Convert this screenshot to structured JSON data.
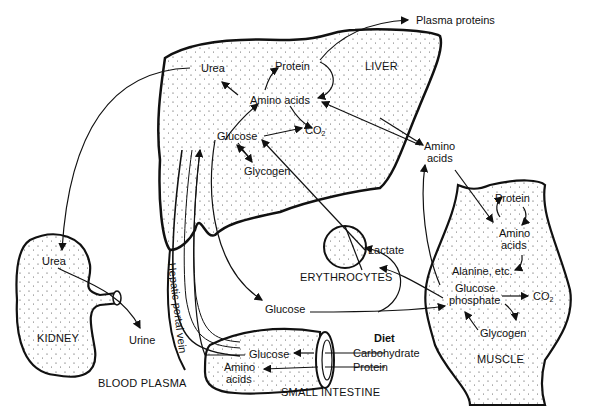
{
  "diagram": {
    "organs": {
      "liver": "LIVER",
      "kidney": "KIDNEY",
      "muscle": "MUSCLE",
      "erythrocytes": "ERYTHROCYTES",
      "small_intestine": "SMALL INTESTINE",
      "blood_plasma": "BLOOD PLASMA",
      "hepatic_portal_vein": "Hepatic portal vein"
    },
    "liver_labels": {
      "urea": "Urea",
      "protein": "Protein",
      "amino_acids": "Amino acids",
      "glucose": "Glucose",
      "co2": "CO",
      "co2_sub": "2",
      "glycogen": "Glycogen"
    },
    "plasma_labels": {
      "plasma_proteins": "Plasma proteins",
      "amino_acids_line1": "Amino",
      "amino_acids_line2": "acids",
      "lactate": "Lactate",
      "glucose": "Glucose",
      "urine": "Urine"
    },
    "kidney_labels": {
      "urea": "Urea"
    },
    "muscle_labels": {
      "protein": "Protein",
      "amino_line1": "Amino",
      "amino_line2": "acids",
      "alanine": "Alanine, etc.",
      "glucose_phosphate_line1": "Glucose",
      "glucose_phosphate_line2": "phosphate",
      "co2": "CO",
      "co2_sub": "2",
      "glycogen": "Glycogen"
    },
    "intestine_labels": {
      "glucose": "Glucose",
      "amino_line1": "Amino",
      "amino_line2": "acids"
    },
    "diet": {
      "title": "Diet",
      "items": [
        "Carbohydrate",
        "Protein"
      ]
    }
  },
  "colors": {
    "ink": "#111111",
    "background": "#ffffff"
  }
}
